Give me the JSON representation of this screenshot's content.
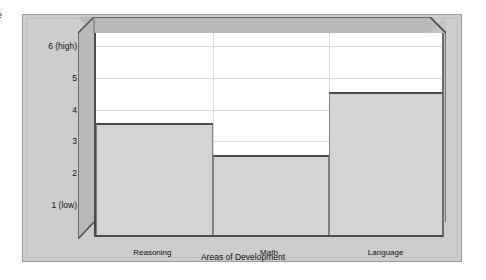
{
  "edge_fragment": "e",
  "chart_data": {
    "type": "bar",
    "title": "",
    "subtitle": "",
    "xlabel": "Areas of Development",
    "ylabel": "",
    "categories": [
      "Reasoning",
      "Math",
      "Language"
    ],
    "values": [
      3.5,
      2.5,
      4.5
    ],
    "series": [
      {
        "name": "Level",
        "values": [
          3.5,
          2.5,
          4.5
        ]
      }
    ],
    "ylim": [
      0,
      6.4
    ],
    "yticks": [
      1,
      2,
      3,
      4,
      5,
      6
    ],
    "ytick_labels": [
      "1 (low)",
      "2",
      "3",
      "4",
      "5",
      "6 (high)"
    ],
    "grid": true,
    "legend": "none",
    "style": "3d-block",
    "colors": {
      "panel": "#cdcdcd",
      "wall": "#b9b9b9",
      "plot_face": "#ffffff",
      "bar_fill": "#d4d4d4",
      "bar_outline": "#4a4a4a",
      "gridline": "#d7d7d7",
      "text": "#111111"
    }
  }
}
